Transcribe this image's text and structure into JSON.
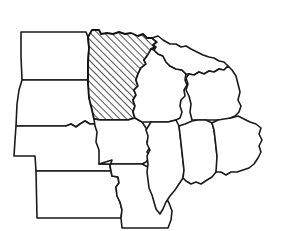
{
  "figure": {
    "kind": "outline-map",
    "region": "Midwestern United States",
    "background_color": "#ffffff",
    "outline_color": "#1a1a1a",
    "highlight_fill": "diagonal-hatch",
    "highlight_line_color": "#1a1a1a",
    "width_px": 284,
    "height_px": 231
  },
  "legend": {
    "hatched_meaning": "highlighted state",
    "plain_meaning": "neighboring state"
  },
  "states": [
    {
      "code": "ND",
      "name": "North Dakota",
      "highlighted": false,
      "fill": "#ffffff",
      "path": "M21,32 L86,32 L88,37 L89,48 L88,62 L88,80 L22,80 L21,56 Z"
    },
    {
      "code": "SD",
      "name": "South Dakota",
      "highlighted": false,
      "fill": "#ffffff",
      "path": "M22,80 L88,80 L92,92 L95,110 L97,124 L90,124 L85,121 L80,124 L76,127 L71,124 L66,126 L16,126 L17,104 L19,90 Z"
    },
    {
      "code": "NE",
      "name": "Nebraska",
      "highlighted": false,
      "fill": "#ffffff",
      "path": "M16,126 L66,126 L71,124 L76,127 L80,124 L85,121 L90,124 L97,124 L99,132 L103,140 L106,148 L110,153 L112,160 L110,166 L111,171 L36,171 L35,156 L14,156 L15,140 Z"
    },
    {
      "code": "KS",
      "name": "Kansas",
      "highlighted": false,
      "fill": "#ffffff",
      "path": "M36,171 L111,171 L112,176 L118,177 L119,183 L116,187 L117,196 L120,202 L122,210 L121,218 L37,218 Z"
    },
    {
      "code": "MN",
      "name": "Minnesota",
      "highlighted": true,
      "fill": "diagonal-hatch",
      "path": "M88,37 L92,30 L99,30 L101,34 L107,33 L113,34 L119,32 L125,34 L131,33 L138,36 L143,34 L147,38 L152,38 L157,42 L153,45 L156,47 L151,49 L156,51 L152,55 L147,56 L144,60 L146,64 L141,68 L138,74 L136,80 L138,86 L134,90 L136,95 L133,100 L135,106 L133,112 L135,118 L128,120 L115,120 L100,120 L94,119 L92,110 L89,98 L88,84 L88,62 L89,48 Z"
    },
    {
      "code": "IA",
      "name": "Iowa",
      "highlighted": false,
      "fill": "#ffffff",
      "path": "M94,119 L100,120 L115,120 L128,120 L135,118 L142,122 L146,128 L149,136 L147,142 L150,147 L147,152 L150,157 L146,162 L142,164 L99,164 L99,150 L96,142 L97,132 L95,126 Z"
    },
    {
      "code": "MO",
      "name": "Missouri",
      "highlighted": false,
      "fill": "#ffffff",
      "path": "M99,164 L142,164 L148,167 L154,174 L158,181 L161,189 L165,196 L169,203 L172,211 L171,220 L168,228 L122,228 L121,218 L122,210 L120,202 L117,196 L116,187 L119,183 L118,177 L112,176 L111,171 L110,166 L112,160 Z"
    },
    {
      "code": "WI",
      "name": "Wisconsin",
      "highlighted": false,
      "fill": "#ffffff",
      "path": "M138,74 L141,68 L146,64 L144,60 L147,56 L151,49 L154,50 L158,54 L163,56 L166,62 L170,66 L176,69 L182,70 L186,74 L185,80 L187,85 L184,90 L185,96 L181,100 L180,106 L182,112 L180,118 L176,120 L168,122 L160,122 L151,122 L142,122 L135,118 L133,112 L135,106 L133,100 L136,95 L134,90 L138,86 L136,80 Z"
    },
    {
      "code": "MI-UP",
      "name": "Michigan Upper Peninsula",
      "highlighted": false,
      "fill": "#ffffff",
      "path": "M152,38 L158,36 L163,40 L170,44 L176,44 L181,47 L186,46 L191,49 L197,52 L203,55 L209,57 L214,58 L219,61 L224,62 L228,66 L224,70 L219,69 L214,72 L209,71 L204,74 L199,72 L194,75 L189,74 L186,74 L182,70 L176,69 L170,66 L166,62 L163,56 L158,54 L154,50 L156,47 L153,45 L157,42 Z"
    },
    {
      "code": "MI-LP",
      "name": "Michigan Lower Peninsula",
      "highlighted": false,
      "fill": "#ffffff",
      "path": "M189,74 L194,75 L199,72 L204,74 L209,71 L214,72 L219,69 L224,70 L228,66 L232,70 L236,76 L238,84 L240,92 L238,100 L241,106 L239,112 L235,116 L228,119 L222,120 L214,120 L206,120 L198,120 L192,120 L190,112 L191,104 L189,96 L186,90 L188,84 L186,78 Z"
    },
    {
      "code": "IL",
      "name": "Illinois",
      "highlighted": false,
      "fill": "#ffffff",
      "path": "M151,122 L160,122 L168,122 L176,120 L179,126 L180,134 L181,143 L182,152 L183,161 L184,170 L183,178 L179,184 L175,190 L170,196 L166,202 L163,209 L160,214 L156,209 L154,202 L152,195 L149,188 L148,180 L147,172 L148,164 L147,156 L150,150 L147,144 L148,136 L146,130 Z"
    },
    {
      "code": "IN",
      "name": "Indiana",
      "highlighted": false,
      "fill": "#ffffff",
      "path": "M179,126 L185,124 L192,121 L198,120 L206,120 L212,123 L214,130 L215,138 L216,147 L217,156 L218,165 L216,172 L212,177 L207,180 L201,184 L196,182 L191,184 L186,181 L183,178 L184,170 L183,161 L182,152 L181,143 L180,134 Z"
    },
    {
      "code": "OH",
      "name": "Ohio",
      "highlighted": false,
      "fill": "#ffffff",
      "path": "M212,123 L218,120 L224,119 L231,118 L238,116 L244,119 L250,122 L256,124 L261,128 L259,134 L262,140 L259,146 L261,152 L258,158 L254,164 L249,168 L243,170 L237,172 L231,172 L226,175 L221,172 L216,172 L217,156 L216,147 L215,138 L214,130 Z"
    }
  ],
  "hatching": {
    "angle_degrees": 45,
    "spacing_px": 5,
    "stroke_width_px": 1.5,
    "color": "#1a1a1a",
    "direction": "lower-left to upper-right"
  }
}
